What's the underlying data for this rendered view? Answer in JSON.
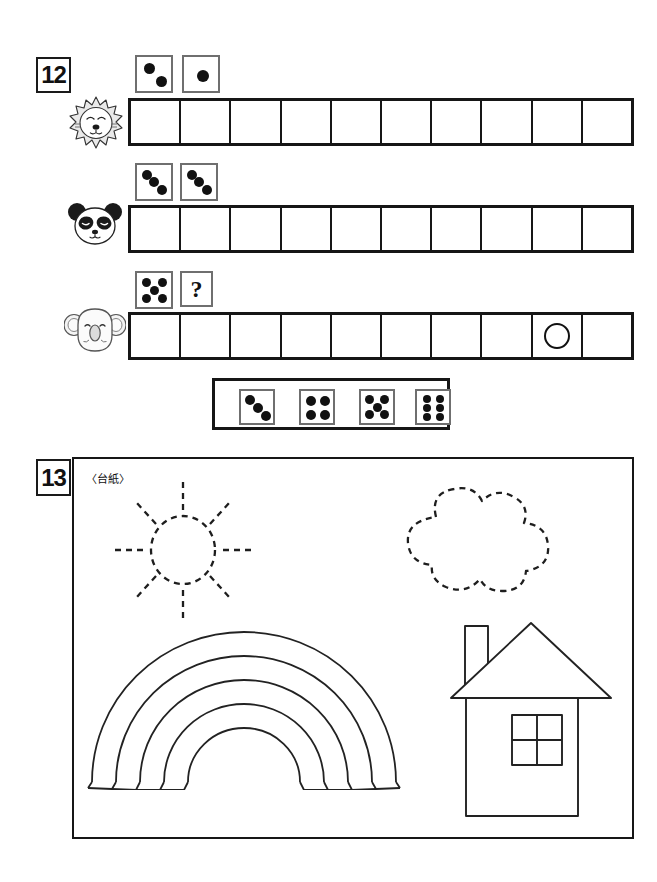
{
  "worksheet": {
    "problems": [
      {
        "number": "12",
        "type": "dice-counting",
        "rows": [
          {
            "animal": "lion-head",
            "dice": [
              {
                "name": "die-2",
                "pips": 2,
                "pattern": "diagonal"
              },
              {
                "name": "die-1",
                "pips": 1,
                "pattern": "center"
              }
            ],
            "cells": 10,
            "marks": []
          },
          {
            "animal": "panda-head",
            "dice": [
              {
                "name": "die-3-a",
                "pips": 3,
                "pattern": "diagonal"
              },
              {
                "name": "die-3-b",
                "pips": 3,
                "pattern": "diagonal"
              }
            ],
            "cells": 10,
            "marks": []
          },
          {
            "animal": "koala-head",
            "dice": [
              {
                "name": "die-5",
                "pips": 5,
                "pattern": "quincunx"
              },
              {
                "name": "question-box",
                "label": "?"
              }
            ],
            "cells": 10,
            "marks": [
              {
                "cell_index": 9,
                "shape": "circle"
              }
            ]
          }
        ],
        "answer_bank": {
          "name": "answer-choice-bank",
          "options": [
            {
              "name": "choice-3",
              "pips": 3,
              "pattern": "diagonal"
            },
            {
              "name": "choice-4",
              "pips": 4,
              "pattern": "corners"
            },
            {
              "name": "choice-5",
              "pips": 5,
              "pattern": "quincunx"
            },
            {
              "name": "choice-6",
              "pips": 6,
              "pattern": "two-columns"
            }
          ]
        }
      },
      {
        "number": "13",
        "caption": "〈台紙〉",
        "type": "cut-and-paste-mount",
        "shapes": [
          {
            "name": "sun-shape",
            "style": "dashed-outline",
            "rays": 8
          },
          {
            "name": "cloud-shape",
            "style": "dashed-outline"
          },
          {
            "name": "rainbow-shape",
            "style": "solid-outline",
            "bands": 4
          },
          {
            "name": "house-shape",
            "style": "solid-outline",
            "parts": [
              "roof",
              "chimney",
              "wall",
              "window-4-pane"
            ]
          }
        ]
      }
    ]
  },
  "colors": {
    "ink": "#161616",
    "die_border": "#6f6f6f",
    "pip": "#111111",
    "paper": "#ffffff",
    "lion_mane": "#e8e8e8",
    "panda_black": "#1a1a1a",
    "koala_gray": "#f0f0f0"
  }
}
